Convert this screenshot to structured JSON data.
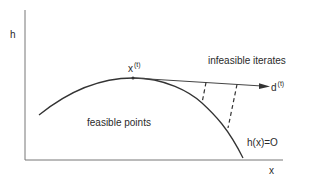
{
  "diagram": {
    "axes": {
      "y_label": "h",
      "x_label": "x"
    },
    "point": {
      "base": "x",
      "superscript": "(t)"
    },
    "direction": {
      "base": "d",
      "superscript": "(t)"
    },
    "regions": {
      "infeasible": "infeasible iterates",
      "feasible": "feasible points"
    },
    "constraint_label": "h(x)=O",
    "colors": {
      "line": "#333333",
      "axis": "#777777"
    }
  }
}
